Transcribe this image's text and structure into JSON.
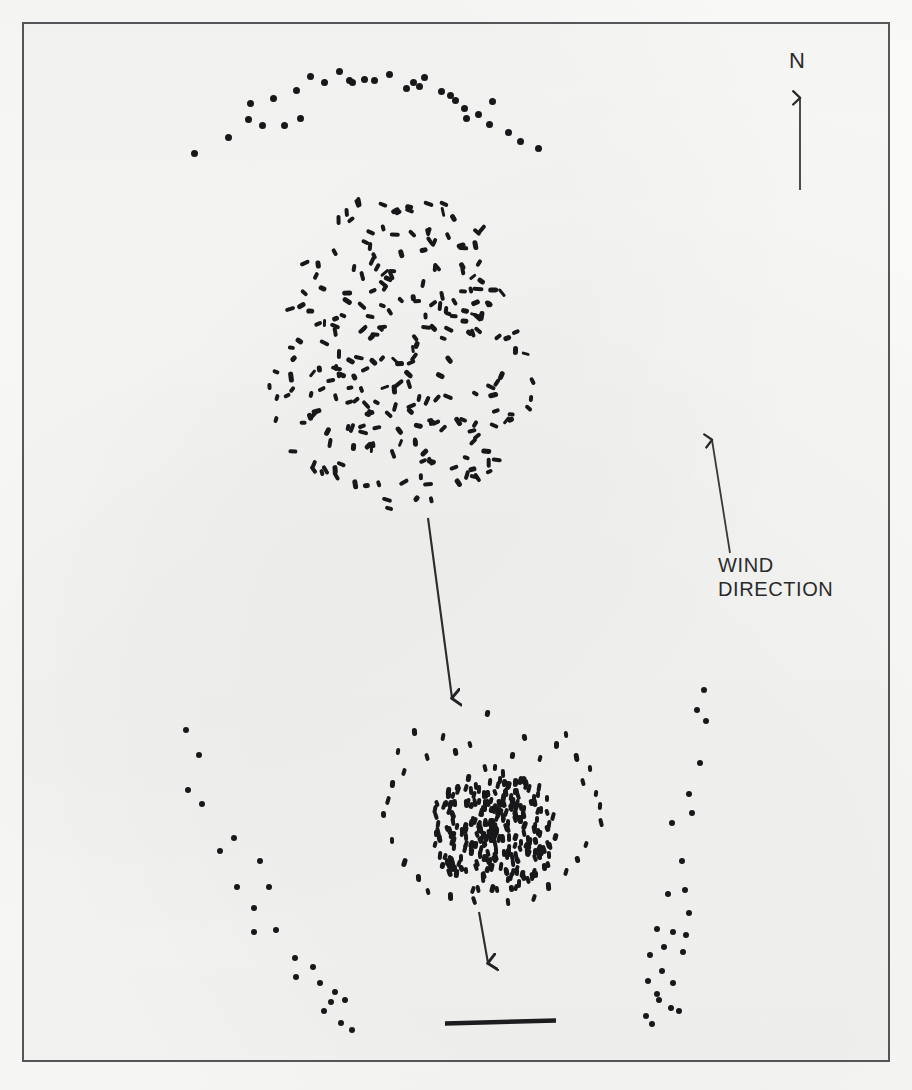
{
  "figure": {
    "type": "scatter",
    "background_color": "#f7f7f5",
    "border_color": "#58585a",
    "mark_color": "#18181a",
    "annotations": {
      "north_label": "N",
      "wind_label": "WIND\nDIRECTION"
    }
  },
  "chart_data": {
    "type": "scatter",
    "title": "",
    "subtitle": "",
    "xlabel": "",
    "ylabel": "",
    "grid": false,
    "legend": null,
    "axis_ranges": {
      "x": [
        22,
        890
      ],
      "y": [
        22,
        1062
      ]
    },
    "annotations": [
      {
        "name": "north-arrow",
        "label": "N",
        "label_x": 800,
        "label_y": 62,
        "x1": 800,
        "y1": 190,
        "x2": 800,
        "y2": 96,
        "direction": "up"
      },
      {
        "name": "wind-direction-arrow",
        "label": "WIND DIRECTION",
        "label_x": 756,
        "label_y": 576,
        "x1": 730,
        "y1": 553,
        "x2": 712,
        "y2": 438,
        "direction": "up-slightly-left"
      },
      {
        "name": "upper-descent-arrow",
        "label": "",
        "x1": 428,
        "y1": 518,
        "x2": 453,
        "y2": 700,
        "direction": "down"
      },
      {
        "name": "lower-descent-arrow",
        "label": "",
        "x1": 479,
        "y1": 912,
        "x2": 489,
        "y2": 966,
        "direction": "down"
      },
      {
        "name": "scale-bar",
        "label": "",
        "x1": 445,
        "y1": 1023,
        "x2": 556,
        "y2": 1021
      }
    ],
    "series": [
      {
        "name": "upper-arc-trace",
        "marker": "round-dot",
        "marker_size_px": 7,
        "count": 30,
        "points": [
          [
            194,
            153
          ],
          [
            228,
            137
          ],
          [
            248,
            119
          ],
          [
            250,
            103
          ],
          [
            262,
            125
          ],
          [
            273,
            98
          ],
          [
            296,
            90
          ],
          [
            310,
            76
          ],
          [
            324,
            82
          ],
          [
            339,
            71
          ],
          [
            349,
            80
          ],
          [
            352,
            82
          ],
          [
            364,
            79
          ],
          [
            374,
            80
          ],
          [
            389,
            74
          ],
          [
            406,
            88
          ],
          [
            413,
            82
          ],
          [
            419,
            86
          ],
          [
            424,
            77
          ],
          [
            441,
            91
          ],
          [
            450,
            95
          ],
          [
            455,
            100
          ],
          [
            464,
            108
          ],
          [
            466,
            118
          ],
          [
            478,
            114
          ],
          [
            489,
            124
          ],
          [
            492,
            101
          ],
          [
            508,
            132
          ],
          [
            520,
            141
          ],
          [
            538,
            148
          ],
          [
            284,
            125
          ],
          [
            300,
            118
          ]
        ]
      },
      {
        "name": "upper-main-swarm",
        "marker": "rod",
        "marker_size_px": [
          4,
          9
        ],
        "count": 250,
        "note": "dense elliptical cluster, random rod orientations"
      },
      {
        "name": "lower-dense-swarm",
        "marker": "rod",
        "marker_size_px": [
          4,
          8
        ],
        "count": 260,
        "note": "compact dense cluster, predominantly vertical rods"
      },
      {
        "name": "left-descending-trace",
        "marker": "round-dot",
        "marker_size_px": 6,
        "count": 22,
        "points": [
          [
            186,
            730
          ],
          [
            199,
            755
          ],
          [
            188,
            790
          ],
          [
            202,
            804
          ],
          [
            234,
            838
          ],
          [
            220,
            851
          ],
          [
            260,
            861
          ],
          [
            237,
            887
          ],
          [
            269,
            887
          ],
          [
            254,
            908
          ],
          [
            254,
            932
          ],
          [
            276,
            930
          ],
          [
            295,
            958
          ],
          [
            313,
            967
          ],
          [
            296,
            977
          ],
          [
            320,
            983
          ],
          [
            335,
            992
          ],
          [
            331,
            1002
          ],
          [
            324,
            1011
          ],
          [
            345,
            1000
          ],
          [
            341,
            1023
          ],
          [
            352,
            1030
          ]
        ]
      },
      {
        "name": "right-descending-trace",
        "marker": "round-dot",
        "marker_size_px": 6,
        "count": 26,
        "points": [
          [
            704,
            690
          ],
          [
            697,
            710
          ],
          [
            706,
            721
          ],
          [
            700,
            763
          ],
          [
            689,
            794
          ],
          [
            692,
            813
          ],
          [
            672,
            823
          ],
          [
            682,
            861
          ],
          [
            685,
            890
          ],
          [
            668,
            894
          ],
          [
            689,
            913
          ],
          [
            657,
            929
          ],
          [
            673,
            932
          ],
          [
            686,
            935
          ],
          [
            664,
            947
          ],
          [
            683,
            952
          ],
          [
            650,
            955
          ],
          [
            662,
            971
          ],
          [
            648,
            981
          ],
          [
            673,
            983
          ],
          [
            657,
            994
          ],
          [
            659,
            1000
          ],
          [
            671,
            1008
          ],
          [
            646,
            1016
          ],
          [
            652,
            1024
          ],
          [
            679,
            1011
          ]
        ]
      }
    ]
  }
}
